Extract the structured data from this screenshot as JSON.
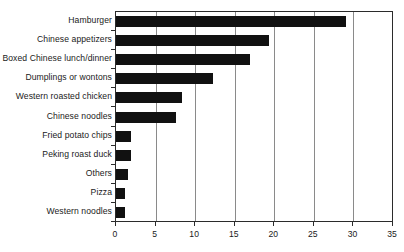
{
  "chart_data": {
    "type": "bar",
    "orientation": "horizontal",
    "title": "",
    "xlabel": "",
    "ylabel": "",
    "xlim": [
      0,
      35
    ],
    "xticks": [
      0,
      5,
      10,
      15,
      20,
      25,
      30,
      35
    ],
    "grid": "vertical",
    "legend": "none",
    "bar_color": "#111111",
    "axis_color": "#2b2b2b",
    "grid_color": "#8a8a8a",
    "categories": [
      "Hamburger",
      "Chinese appetizers",
      "Boxed Chinese lunch/dinner",
      "Dumplings or wontons",
      "Western roasted chicken",
      "Chinese noodles",
      "Fried potato chips",
      "Peking roast duck",
      "Others",
      "Pizza",
      "Western noodles"
    ],
    "values": [
      29.0,
      19.3,
      16.9,
      12.3,
      8.3,
      7.6,
      1.9,
      1.9,
      1.5,
      1.1,
      1.2
    ]
  }
}
